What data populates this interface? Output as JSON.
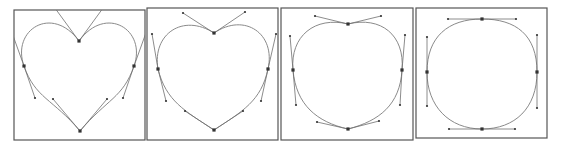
{
  "figure": {
    "colors": {
      "border": "#555555",
      "curve": "#8a8a8a",
      "handle_line": "#6e6e6e",
      "point": "#333333",
      "background": "#ffffff"
    },
    "panels": [
      {
        "id": "heart-sharp",
        "frame": {
          "x": 14,
          "y": 10,
          "w": 131,
          "h": 130
        },
        "anchors": [
          {
            "name": "top",
            "p": [
              79,
              41
            ],
            "in": [
              52,
              4
            ],
            "out": [
              106,
              4
            ]
          },
          {
            "name": "right",
            "p": [
              134,
              66
            ],
            "in": [
              147,
              30
            ],
            "out": [
              123,
              98
            ]
          },
          {
            "name": "bottom",
            "p": [
              80,
              131
            ],
            "in": [
              107,
              99
            ],
            "out": [
              53,
              99
            ]
          },
          {
            "name": "left",
            "p": [
              24,
              66
            ],
            "in": [
              35,
              98
            ],
            "out": [
              11,
              30
            ]
          }
        ]
      },
      {
        "id": "heart-soft",
        "frame": {
          "x": 147,
          "y": 8,
          "w": 131,
          "h": 132
        },
        "anchors": [
          {
            "name": "top",
            "p": [
              214,
              33
            ],
            "in": [
              183,
              13
            ],
            "out": [
              245,
              12
            ]
          },
          {
            "name": "right",
            "p": [
              268,
              69
            ],
            "in": [
              276,
              34
            ],
            "out": [
              261,
              101
            ]
          },
          {
            "name": "bottom",
            "p": [
              214,
              130
            ],
            "in": [
              243,
              111
            ],
            "out": [
              185,
              111
            ]
          },
          {
            "name": "left",
            "p": [
              158,
              69
            ],
            "in": [
              166,
              101
            ],
            "out": [
              152,
              34
            ]
          }
        ]
      },
      {
        "id": "apple-shape",
        "frame": {
          "x": 281,
          "y": 8,
          "w": 132,
          "h": 132
        },
        "anchors": [
          {
            "name": "top",
            "p": [
              348,
              24
            ],
            "in": [
              315,
              16
            ],
            "out": [
              381,
              16
            ]
          },
          {
            "name": "right",
            "p": [
              402,
              70
            ],
            "in": [
              405,
              35
            ],
            "out": [
              400,
              105
            ]
          },
          {
            "name": "bottom",
            "p": [
              348,
              129
            ],
            "in": [
              379,
              121
            ],
            "out": [
              317,
              122
            ]
          },
          {
            "name": "left",
            "p": [
              293,
              70
            ],
            "in": [
              296,
              105
            ],
            "out": [
              290,
              36
            ]
          }
        ]
      },
      {
        "id": "rounded-square",
        "frame": {
          "x": 416,
          "y": 8,
          "w": 131,
          "h": 130
        },
        "anchors": [
          {
            "name": "top",
            "p": [
              482,
              19
            ],
            "in": [
              448,
              19
            ],
            "out": [
              516,
              19
            ]
          },
          {
            "name": "right",
            "p": [
              537,
              72
            ],
            "in": [
              537,
              35
            ],
            "out": [
              537,
              108
            ]
          },
          {
            "name": "bottom",
            "p": [
              482,
              129
            ],
            "in": [
              515,
              129
            ],
            "out": [
              449,
              129
            ]
          },
          {
            "name": "left",
            "p": [
              427,
              72
            ],
            "in": [
              427,
              106
            ],
            "out": [
              427,
              37
            ]
          }
        ]
      }
    ]
  }
}
